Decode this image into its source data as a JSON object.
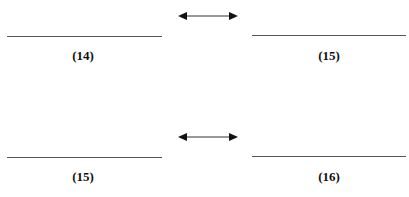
{
  "rows": [
    {
      "left_label": "(14)",
      "right_label": "(15)",
      "relation": "double-arrow-icon"
    },
    {
      "left_label": "(15)",
      "right_label": "(16)",
      "relation": "double-arrow-icon"
    }
  ]
}
